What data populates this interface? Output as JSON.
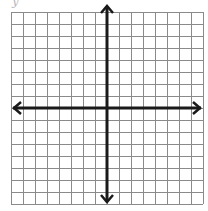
{
  "diagram": {
    "type": "coordinate-grid",
    "label": "y",
    "grid": {
      "columns": 16,
      "rows": 16,
      "cell_size_px": 12,
      "origin_column": 8,
      "origin_row": 8,
      "line_color": "#8a8a8a",
      "axis_color": "#1a1a1a"
    },
    "axes": {
      "x_axis": {
        "arrows": "both"
      },
      "y_axis": {
        "arrows": "both"
      }
    }
  }
}
